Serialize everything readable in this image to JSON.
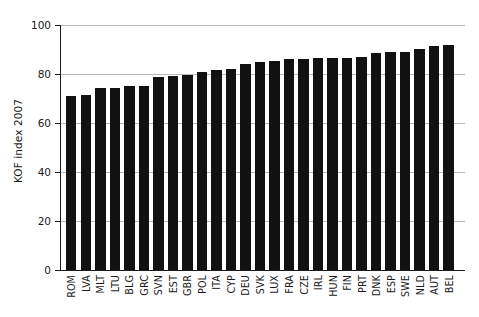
{
  "chart_data": {
    "type": "bar",
    "title": "",
    "xlabel": "",
    "ylabel": "KOF index 2007",
    "ylim": [
      0,
      100
    ],
    "yticks": [
      0,
      20,
      40,
      60,
      80,
      100
    ],
    "gridlines": [
      "20",
      "40",
      "60",
      "80",
      "100"
    ],
    "grid": true,
    "legend": "none",
    "bar_color": "#111111",
    "categories": [
      "ROM",
      "LVA",
      "MLT",
      "LTU",
      "BLG",
      "GRC",
      "SVN",
      "EST",
      "GBR",
      "POL",
      "ITA",
      "CYP",
      "DEU",
      "SVK",
      "LUX",
      "FRA",
      "CZE",
      "IRL",
      "HUN",
      "FIN",
      "PRT",
      "DNK",
      "ESP",
      "SWE",
      "NLD",
      "AUT",
      "BEL"
    ],
    "values": [
      71.2,
      71.3,
      74.4,
      74.4,
      75.0,
      75.3,
      78.6,
      79.1,
      79.8,
      80.9,
      81.5,
      81.9,
      84.0,
      84.8,
      85.3,
      86.1,
      86.3,
      86.4,
      86.4,
      86.4,
      86.8,
      88.7,
      88.9,
      89.0,
      90.4,
      91.4,
      91.7
    ]
  },
  "axis": {
    "y_title": "KOF index 2007",
    "y_tick_labels": [
      "0",
      "20",
      "40",
      "60",
      "80",
      "100"
    ]
  }
}
